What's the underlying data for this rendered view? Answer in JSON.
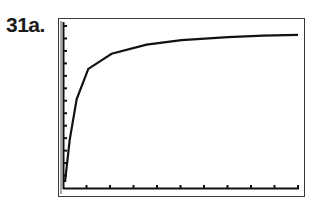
{
  "problem_label": "31a.",
  "chart_data": {
    "type": "line",
    "title": "",
    "xlabel": "",
    "ylabel": "",
    "grid": false,
    "legend": null,
    "x_ticks": 10,
    "y_ticks": 13,
    "x": [
      0.0,
      0.02,
      0.05,
      0.1,
      0.2,
      0.35,
      0.5,
      0.7,
      0.85,
      1.0
    ],
    "values": [
      0.0,
      0.28,
      0.55,
      0.75,
      0.85,
      0.91,
      0.94,
      0.96,
      0.97,
      0.975
    ],
    "curve_color": "#111111"
  }
}
